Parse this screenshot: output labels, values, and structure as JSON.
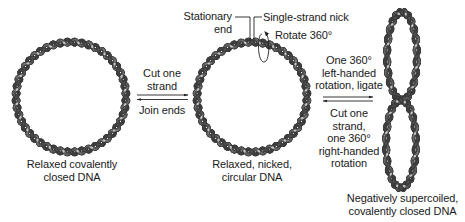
{
  "diagram": {
    "colors": {
      "strand_dark": "#4f4f4f",
      "strand_light": "#c4c4c4",
      "outline": "#3a3a3a",
      "text": "#1a1a1a",
      "arrow": "#222222"
    },
    "nodes": [
      {
        "id": "relaxed_closed",
        "shape": "circle",
        "caption": [
          "Relaxed covalently",
          "closed DNA"
        ]
      },
      {
        "id": "relaxed_nicked",
        "shape": "circle",
        "caption": [
          "Relaxed, nicked,",
          "circular DNA"
        ],
        "annotations": {
          "stationary_end": [
            "Stationary",
            "end"
          ],
          "nick": "Single-strand nick",
          "rotate": "Rotate 360°"
        }
      },
      {
        "id": "neg_supercoiled",
        "shape": "figure-eight",
        "caption": [
          "Negatively supercoiled,",
          "covalently closed DNA"
        ]
      }
    ],
    "edges": [
      {
        "from": "relaxed_closed",
        "to": "relaxed_nicked",
        "label": [
          "Cut one",
          "strand"
        ]
      },
      {
        "from": "relaxed_nicked",
        "to": "relaxed_closed",
        "label": [
          "Join ends"
        ]
      },
      {
        "from": "relaxed_nicked",
        "to": "neg_supercoiled",
        "label": [
          "One 360°",
          "left-handed",
          "rotation, ligate"
        ]
      },
      {
        "from": "neg_supercoiled",
        "to": "relaxed_nicked",
        "label": [
          "Cut one",
          "strand,",
          "one 360°",
          "right-handed",
          "rotation"
        ]
      }
    ]
  }
}
